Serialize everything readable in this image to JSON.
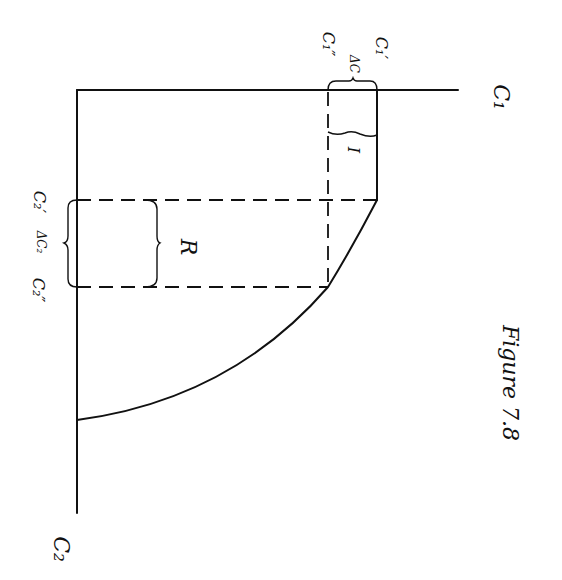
{
  "figure": {
    "caption": "Figure 7.8",
    "orientation": "rotated 90° clockwise",
    "ink_color": "#111111",
    "background": "#ffffff"
  },
  "labels": {
    "axis_c1": "C₁",
    "axis_c2": "C₂",
    "c1_prime": "C₁′",
    "c1_double_prime": "C₁″",
    "delta_c1": "ΔC",
    "c2_prime": "C₂′",
    "c2_double_prime": "C₂″",
    "delta_c2": "ΔC₂",
    "region_i": "I",
    "region_r": "R"
  },
  "geometry": {
    "axis_vertical": {
      "x": 77,
      "y1": 90,
      "y2": 513
    },
    "axis_horizontal": {
      "y": 90,
      "x1": 77,
      "x2": 458
    },
    "solid_segment": {
      "x": 377,
      "y1": 90,
      "y2": 200
    },
    "dashed_h1": {
      "y": 200,
      "x1": 77,
      "x2": 377
    },
    "dashed_v": {
      "x": 328,
      "y1": 90,
      "y2": 287
    },
    "dashed_h2": {
      "y": 287,
      "x1": 77,
      "x2": 328
    },
    "curve_points": [
      [
        377,
        200
      ],
      [
        328,
        287
      ],
      [
        77,
        420
      ]
    ]
  }
}
